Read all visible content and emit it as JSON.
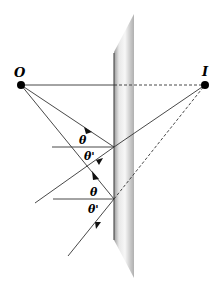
{
  "diagram": {
    "type": "plane-mirror-reflection-ray-diagram",
    "labels": {
      "object": "O",
      "image": "I",
      "angle_incidence_1": "θ",
      "angle_reflection_1": "θ'",
      "angle_incidence_2": "θ",
      "angle_reflection_2": "θ'"
    },
    "colors": {
      "ray": "#333333",
      "point": "#000000",
      "mirror_light": "#f4f4f4",
      "mirror_dark": "#a8a8a8",
      "mirror_edge": "#555555"
    }
  }
}
